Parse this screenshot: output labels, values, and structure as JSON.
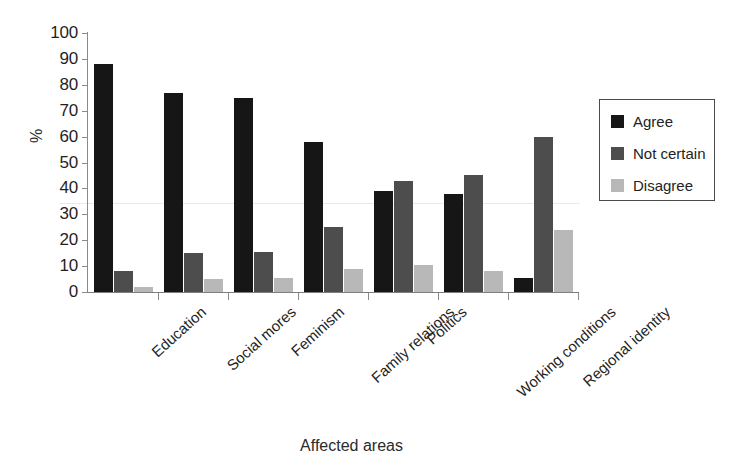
{
  "chart_data": {
    "type": "bar",
    "title": "",
    "xlabel": "Affected areas",
    "ylabel": "%",
    "ylim": [
      0,
      100
    ],
    "yticks": [
      0,
      10,
      20,
      30,
      40,
      50,
      60,
      70,
      80,
      90,
      100
    ],
    "grid": false,
    "legend_position": "right",
    "categories": [
      "Education",
      "Social mores",
      "Feminism",
      "Family relations",
      "Politics",
      "Working conditions",
      "Regional identity"
    ],
    "series": [
      {
        "name": "Agree",
        "color": "#161616",
        "values": [
          88,
          77,
          75,
          58,
          39,
          38,
          5.5
        ]
      },
      {
        "name": "Not certain",
        "color": "#4d4d4d",
        "values": [
          8,
          15,
          15.5,
          25,
          43,
          45,
          60
        ]
      },
      {
        "name": "Disagree",
        "color": "#b8b8b8",
        "values": [
          2,
          5,
          5.5,
          9,
          10.5,
          8,
          24
        ]
      }
    ]
  },
  "axes": {
    "y_title": "%",
    "x_title": "Affected areas"
  },
  "legend": {
    "entries": [
      {
        "label": "Agree",
        "color": "#161616"
      },
      {
        "label": "Not certain",
        "color": "#4d4d4d"
      },
      {
        "label": "Disagree",
        "color": "#b8b8b8"
      }
    ]
  }
}
